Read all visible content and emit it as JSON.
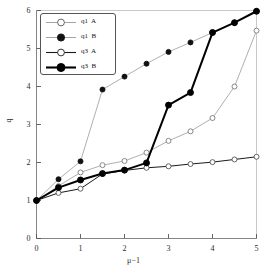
{
  "chart_data": {
    "type": "line",
    "title": "",
    "xlabel": "μ−1",
    "ylabel": "q",
    "xlim": [
      0,
      5
    ],
    "ylim": [
      0,
      6
    ],
    "xticks": [
      0,
      1,
      2,
      3,
      4,
      5
    ],
    "yticks": [
      0,
      1,
      2,
      3,
      4,
      5,
      6
    ],
    "xtick_labels": [
      "0",
      "1",
      "2",
      "3",
      "4",
      "5"
    ],
    "ytick_labels": [
      "0",
      "1",
      "2",
      "3",
      "4",
      "5",
      "6"
    ],
    "grid": false,
    "legend_position": "upper left",
    "x": [
      0,
      0.5,
      1,
      1.5,
      2,
      2.5,
      3,
      3.5,
      4,
      4.5,
      5
    ],
    "series": [
      {
        "name": "q1  A",
        "marker": "open-circle",
        "line_color": "#9a9a9a",
        "line_width": 0.8,
        "marker_edge_color": "#7a7a7a",
        "marker_face_color": "#ffffff",
        "values": [
          1.0,
          1.38,
          1.74,
          1.93,
          2.04,
          2.26,
          2.57,
          2.82,
          3.17,
          4.0,
          5.47
        ]
      },
      {
        "name": "q1  B",
        "marker": "filled-circle",
        "line_color": "#9a9a9a",
        "line_width": 0.8,
        "marker_edge_color": "#111111",
        "marker_face_color": "#111111",
        "values": [
          1.0,
          1.56,
          2.03,
          3.92,
          4.26,
          4.6,
          4.91,
          5.16,
          5.42,
          5.68,
          5.98
        ]
      },
      {
        "name": "q3  A",
        "marker": "open-circle",
        "line_color": "#1a1a1a",
        "line_width": 1.0,
        "marker_edge_color": "#555555",
        "marker_face_color": "#ffffff",
        "values": [
          1.0,
          1.2,
          1.31,
          1.7,
          1.79,
          1.86,
          1.9,
          1.96,
          2.01,
          2.08,
          2.15
        ]
      },
      {
        "name": "q3  B",
        "marker": "filled-circle",
        "line_color": "#000000",
        "line_width": 2.0,
        "marker_edge_color": "#000000",
        "marker_face_color": "#000000",
        "values": [
          1.0,
          1.34,
          1.54,
          1.71,
          1.8,
          1.99,
          3.51,
          3.84,
          5.42,
          5.68,
          5.98
        ]
      }
    ]
  },
  "axes": {
    "x_tick_labels": [
      "0",
      "1",
      "2",
      "3",
      "4",
      "5"
    ],
    "y_tick_labels": [
      "0",
      "1",
      "2",
      "3",
      "4",
      "5",
      "6"
    ],
    "x_axis_title": "μ−1",
    "y_axis_title": "q"
  },
  "legend": {
    "entries": [
      {
        "label": "q1  A"
      },
      {
        "label": "q1  B"
      },
      {
        "label": "q3  A"
      },
      {
        "label": "q3  B"
      }
    ]
  }
}
